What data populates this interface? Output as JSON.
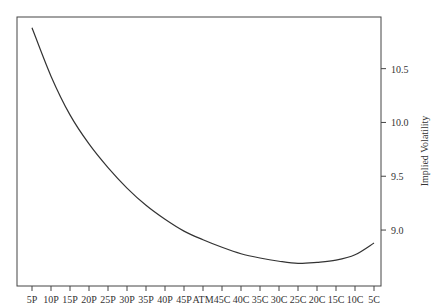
{
  "chart_data": {
    "type": "line",
    "title": "",
    "xlabel": "",
    "ylabel": "Implied Volatility",
    "categories": [
      "5P",
      "10P",
      "15P",
      "20P",
      "25P",
      "30P",
      "35P",
      "40P",
      "45P",
      "ATM",
      "45C",
      "40C",
      "35C",
      "30C",
      "25C",
      "20C",
      "15C",
      "10C",
      "5C"
    ],
    "series": [
      {
        "name": "Implied Volatility",
        "values": [
          10.88,
          10.43,
          10.07,
          9.8,
          9.58,
          9.39,
          9.23,
          9.1,
          8.99,
          8.91,
          8.84,
          8.78,
          8.74,
          8.71,
          8.69,
          8.7,
          8.72,
          8.77,
          8.88
        ]
      }
    ],
    "yticks": [
      9.0,
      9.5,
      10.0,
      10.5
    ],
    "ytick_labels": [
      "9.0",
      "9.5",
      "10.0",
      "10.5"
    ],
    "ylim": [
      8.48,
      10.98
    ],
    "y_axis_side": "right",
    "grid": false,
    "legend": "none",
    "colors": {
      "line": "#333333",
      "axis": "#444444"
    }
  }
}
